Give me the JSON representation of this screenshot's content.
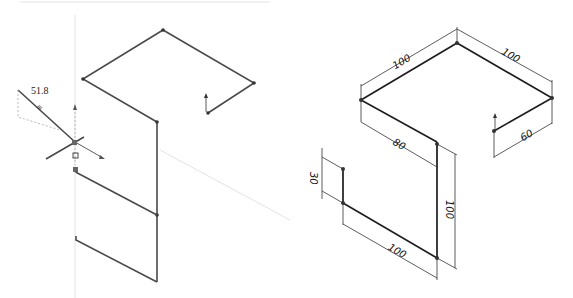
{
  "left_view": {
    "description": "3D sketch in progress",
    "live_dimension": "51.8",
    "cursor_glyph": "≡"
  },
  "right_view": {
    "description": "Dimensioned 3D sketch",
    "dimensions": {
      "top_left_edge": "100",
      "top_right_edge": "100",
      "middle_edge": "80",
      "right_short_edge": "60",
      "vertical_small": "30",
      "vertical_large": "100",
      "bottom_edge": "100"
    }
  },
  "colors": {
    "sketch_line": "#4a4a4a",
    "dimension_line": "#333333",
    "background": "#ffffff"
  }
}
